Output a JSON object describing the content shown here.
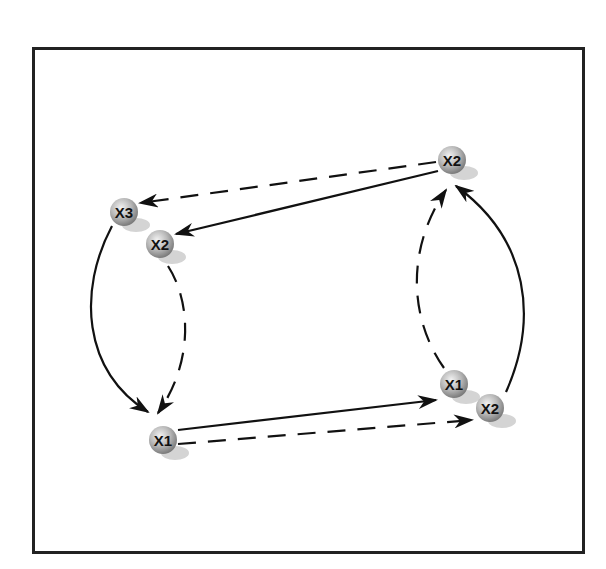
{
  "diagram": {
    "type": "state-transition-diagram",
    "colors": {
      "frame": "#222222",
      "edge": "#111111",
      "node_light": "#e6e6e6",
      "node_dark": "#8a8a8a",
      "shadow": "#d0d0d0"
    },
    "nodes": [
      {
        "id": "x3_left",
        "label": "X3",
        "cx": 124,
        "cy": 212
      },
      {
        "id": "x2_left",
        "label": "X2",
        "cx": 160,
        "cy": 244
      },
      {
        "id": "x1_bottom",
        "label": "X1",
        "cx": 163,
        "cy": 440
      },
      {
        "id": "x2_top",
        "label": "X2",
        "cx": 452,
        "cy": 160
      },
      {
        "id": "x1_right",
        "label": "X1",
        "cx": 454,
        "cy": 384
      },
      {
        "id": "x2_right",
        "label": "X2",
        "cx": 490,
        "cy": 408
      }
    ],
    "edges": [
      {
        "id": "x2top-to-x3",
        "from": "X2 (top right)",
        "to": "X3 (left)",
        "style": "dashed"
      },
      {
        "id": "x2top-to-x2left",
        "from": "X2 (top right)",
        "to": "X2 (left)",
        "style": "solid"
      },
      {
        "id": "x3-to-x1",
        "from": "X3 (left)",
        "to": "X1 (bottom)",
        "style": "solid",
        "curved": true
      },
      {
        "id": "x2left-to-x1",
        "from": "X2 (left)",
        "to": "X1 (bottom)",
        "style": "dashed",
        "curved": true
      },
      {
        "id": "x1-to-x1right",
        "from": "X1 (bottom)",
        "to": "X1 (right)",
        "style": "solid"
      },
      {
        "id": "x1-to-x2right",
        "from": "X1 (bottom)",
        "to": "X2 (right)",
        "style": "dashed"
      },
      {
        "id": "x1right-to-x2top",
        "from": "X1 (right)",
        "to": "X2 (top right)",
        "style": "dashed",
        "curved": true
      },
      {
        "id": "x2right-to-x2top",
        "from": "X2 (right)",
        "to": "X2 (top right)",
        "style": "solid",
        "curved": true
      }
    ]
  }
}
